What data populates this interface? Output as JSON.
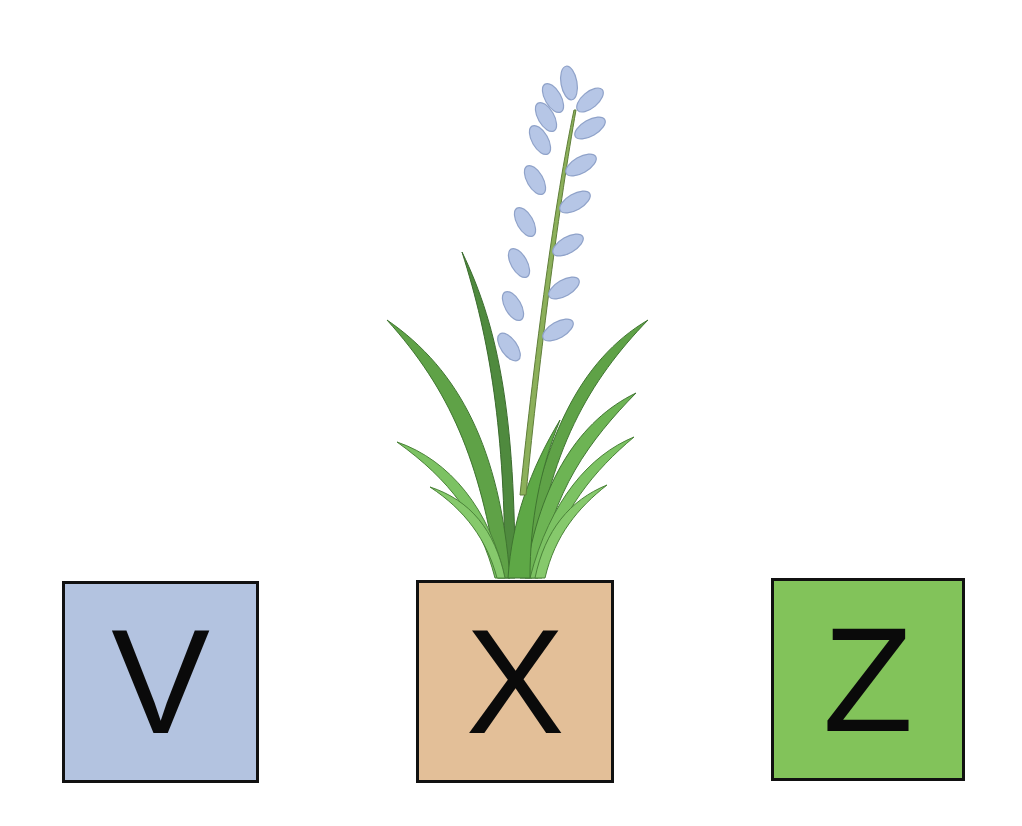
{
  "diagram": {
    "boxes": [
      {
        "label": "V",
        "color": "#b3c3e0"
      },
      {
        "label": "X",
        "color": "#e3bf98"
      },
      {
        "label": "Z",
        "color": "#82c35a"
      }
    ],
    "plant": {
      "position": "above box X",
      "leaf_colors": [
        "#5a9e45",
        "#78b85c",
        "#4e8a3c"
      ],
      "stem_color": "#8cb05a",
      "flower_color": "#b6c6e6",
      "flower_outline": "#8fa2c9"
    }
  }
}
